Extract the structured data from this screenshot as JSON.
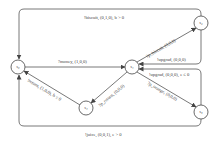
{
  "nodes": [
    {
      "id": "s0",
      "label": "s₀"
    },
    {
      "id": "s1",
      "label": "s₁"
    },
    {
      "id": "s2",
      "label": "s₂"
    },
    {
      "id": "s3",
      "label": "s₃"
    },
    {
      "id": "s4",
      "label": "s₄"
    }
  ],
  "edges": [
    {
      "from": "s0",
      "to": "s1",
      "label": "?money, (1,0,0)"
    },
    {
      "from": "s2",
      "to": "s0",
      "label": "!biscuit, (0,1,0), b > 0"
    },
    {
      "from": "s1",
      "to": "s2",
      "label": "?p_biscuit, (0,0,0)"
    },
    {
      "from": "s2",
      "to": "s1",
      "label": "!upgrad, (0,0,0)"
    },
    {
      "from": "s3",
      "to": "s1",
      "label": "!upgrad, (0,0,0), e ≤ 0"
    },
    {
      "from": "s1",
      "to": "s3",
      "label": "?p_orange, (0,0,0)"
    },
    {
      "from": "s1",
      "to": "s4",
      "label": "?p_return, (0,0,0)"
    },
    {
      "from": "s4",
      "to": "s0",
      "label": "!return, (1,0,0), b ≤ 0"
    },
    {
      "from": "s3",
      "to": "s0",
      "label": "!juice, (0,0,1), e > 0"
    }
  ]
}
